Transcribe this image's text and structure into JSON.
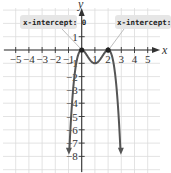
{
  "chart_data": {
    "type": "line",
    "title": "",
    "function": "f(x) = -x^2 (x - 2)^2",
    "xlabel": "x",
    "ylabel": "y",
    "xlim": [
      -5.5,
      5.5
    ],
    "ylim": [
      -9,
      3
    ],
    "grid": true,
    "x_ticks": [
      -5,
      -4,
      -3,
      -2,
      -1,
      1,
      2,
      3,
      4,
      5
    ],
    "x_tick_labels": [
      "-5",
      "-4",
      "-3",
      "-2",
      "-1",
      "1",
      "2",
      "3",
      "4",
      "5"
    ],
    "y_ticks": [
      1,
      -1,
      -2,
      -3,
      -4,
      -5,
      -6,
      -7,
      -8
    ],
    "y_tick_labels": [
      "1",
      "-1",
      "-2",
      "-3",
      "-4",
      "-5",
      "-6",
      "-7",
      "-8"
    ],
    "series": [
      {
        "name": "f(x)",
        "x": [
          -1.0,
          -0.8,
          -0.6,
          -0.4,
          -0.2,
          0,
          0.25,
          0.5,
          0.75,
          1,
          1.25,
          1.5,
          1.75,
          2,
          2.2,
          2.4,
          2.6,
          2.8,
          3.0
        ],
        "values": [
          -9.0,
          -5.02,
          -2.44,
          -0.92,
          -0.19,
          0,
          -0.27,
          -0.56,
          -0.79,
          -1,
          -0.79,
          -0.56,
          -0.27,
          0,
          -0.19,
          -0.92,
          -2.44,
          -5.02,
          -9.0
        ]
      }
    ],
    "points": [
      {
        "x": 0,
        "y": 0,
        "label": "x-intercept: 0"
      },
      {
        "x": 2,
        "y": 0,
        "label": "x-intercept: 2"
      }
    ],
    "annotations": [
      "x-intercept: 0",
      "x-intercept: 2"
    ]
  },
  "labels": {
    "x_axis": "x",
    "y_axis": "y",
    "callout_left": "x-intercept: 0",
    "callout_right": "x-intercept: 2",
    "x_ticks": [
      "−5",
      "−4",
      "−3",
      "−2",
      "−1",
      "1",
      "2",
      "3",
      "4",
      "5"
    ],
    "y_ticks": [
      "1",
      "−1",
      "−2",
      "−3",
      "−4",
      "−5",
      "−6",
      "−7",
      "−8"
    ]
  }
}
